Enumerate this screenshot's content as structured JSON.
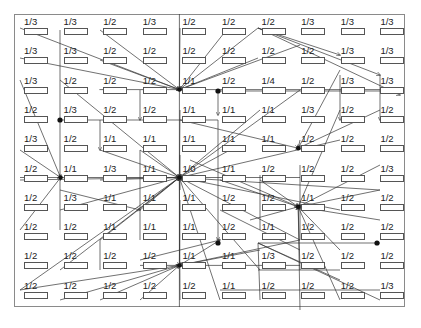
{
  "diagram": {
    "type": "grid-flow-diagram",
    "columns": 10,
    "rows": 10,
    "line_color": "#333333",
    "frame_color": "#8a8a8a",
    "labels": [
      [
        "1/3",
        "1/3",
        "1/2",
        "1/3",
        "1/2",
        "1/2",
        "1/2",
        "1/3",
        "1/3",
        "1/3"
      ],
      [
        "1/3",
        "1/3",
        "1/2",
        "1/2",
        "1/2",
        "1/2",
        "1/2",
        "1/2",
        "1/3",
        "1/3"
      ],
      [
        "1/3",
        "1/2",
        "1/2",
        "1/2",
        "1/1",
        "1/2",
        "1/4",
        "1/2",
        "1/3",
        "1/3"
      ],
      [
        "1/2",
        "1/3",
        "1/2",
        "1/2",
        "1/1",
        "1/1",
        "1/1",
        "1/3",
        "1/2",
        "1/2"
      ],
      [
        "1/3",
        "1/2",
        "1/1",
        "1/1",
        "1/1",
        "1/1",
        "1/1",
        "1/2",
        "1/2",
        "1/2"
      ],
      [
        "1/2",
        "1/1",
        "1/3",
        "1/1",
        "1/0",
        "1/1",
        "1/2",
        "1/2",
        "1/2",
        "1/3"
      ],
      [
        "1/2",
        "1/3",
        "1/1",
        "1/1",
        "1/1",
        "1/2",
        "1/2",
        "1/1",
        "1/2",
        "1/2"
      ],
      [
        "1/2",
        "1/2",
        "1/1",
        "1/1",
        "1/1",
        "1/2",
        "1/1",
        "1/2",
        "1/2",
        "1/2"
      ],
      [
        "1/2",
        "1/2",
        "1/2",
        "1/2",
        "1/1",
        "1/1",
        "1/3",
        "1/2",
        "1/2",
        "1/2"
      ],
      [
        "1/2",
        "1/2",
        "1/2",
        "1/2",
        "1/2",
        "1/1",
        "1/2",
        "1/2",
        "1/2",
        "1/3"
      ]
    ],
    "hubs": [
      {
        "name": "hub-top",
        "col": 4,
        "row": 2
      },
      {
        "name": "hub-center",
        "col": 4,
        "row": 5
      },
      {
        "name": "hub-right",
        "col": 7,
        "row": 6
      },
      {
        "name": "hub-bottom",
        "col": 4,
        "row": 8
      },
      {
        "name": "hub-left",
        "col": 1,
        "row": 5
      },
      {
        "name": "hub-mid-right",
        "col": 7,
        "row": 4
      }
    ],
    "dots": [
      {
        "x": 218,
        "y": 91
      },
      {
        "x": 60,
        "y": 120
      },
      {
        "x": 218,
        "y": 243
      },
      {
        "x": 377,
        "y": 243
      }
    ]
  }
}
